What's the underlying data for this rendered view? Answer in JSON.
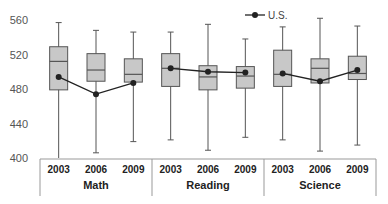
{
  "chart_data": {
    "type": "boxplot",
    "title": "",
    "xlabel": "",
    "ylabel": "",
    "ylim": [
      400,
      560
    ],
    "yticks": [
      400,
      440,
      480,
      520,
      560
    ],
    "grid": false,
    "legend": {
      "position": "top-right",
      "entries": [
        "U.S."
      ]
    },
    "groups": [
      {
        "name": "Math",
        "categories": [
          "2003",
          "2006",
          "2009"
        ],
        "boxes": [
          {
            "whisker_low": 400,
            "q1": 479,
            "median": 512,
            "q3": 529,
            "whisker_high": 557
          },
          {
            "whisker_low": 406,
            "q1": 489,
            "median": 502,
            "q3": 521,
            "whisker_high": 548
          },
          {
            "whisker_low": 419,
            "q1": 488,
            "median": 497,
            "q3": 515,
            "whisker_high": 546
          }
        ],
        "us": [
          494,
          474,
          487
        ]
      },
      {
        "name": "Reading",
        "categories": [
          "2003",
          "2006",
          "2009"
        ],
        "boxes": [
          {
            "whisker_low": 421,
            "q1": 483,
            "median": 504,
            "q3": 521,
            "whisker_high": 546
          },
          {
            "whisker_low": 409,
            "q1": 479,
            "median": 494,
            "q3": 507,
            "whisker_high": 555
          },
          {
            "whisker_low": 424,
            "q1": 481,
            "median": 495,
            "q3": 506,
            "whisker_high": 538
          }
        ],
        "us": [
          504,
          500,
          499
        ]
      },
      {
        "name": "Science",
        "categories": [
          "2003",
          "2006",
          "2009"
        ],
        "boxes": [
          {
            "whisker_low": 421,
            "q1": 483,
            "median": 497,
            "q3": 525,
            "whisker_high": 552
          },
          {
            "whisker_low": 408,
            "q1": 487,
            "median": 504,
            "q3": 515,
            "whisker_high": 562
          },
          {
            "whisker_low": 415,
            "q1": 491,
            "median": 498,
            "q3": 518,
            "whisker_high": 553
          }
        ],
        "us": [
          498,
          489,
          502
        ]
      }
    ],
    "colors": {
      "box_fill": "#c8c8c8",
      "box_stroke": "#555555",
      "line": "#222222",
      "axis": "#999999"
    }
  }
}
